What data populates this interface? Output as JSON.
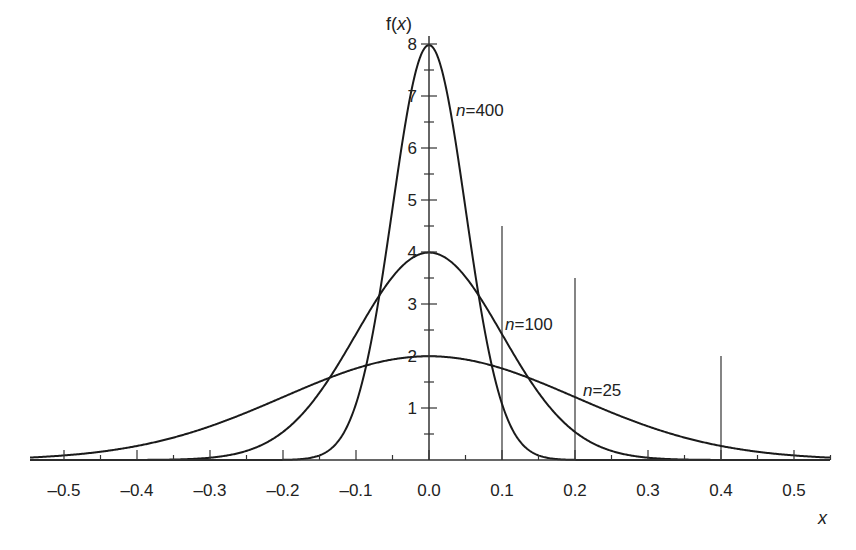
{
  "chart_data": {
    "type": "line",
    "title": "",
    "xlabel": "x",
    "ylabel": "f(x)",
    "xlim": [
      -0.55,
      0.55
    ],
    "ylim": [
      0,
      8.2
    ],
    "grid": false,
    "legend": "inline curve labels",
    "x_ticks": [
      "-0.5",
      "-0.4",
      "-0.3",
      "-0.2",
      "-0.1",
      "0.0",
      "0.1",
      "0.2",
      "0.3",
      "0.4",
      "0.5"
    ],
    "y_ticks": [
      "1",
      "2",
      "3",
      "4",
      "5",
      "6",
      "7",
      "8"
    ],
    "series": [
      {
        "name": "n=400",
        "label_n": "n",
        "label_val": "400",
        "distribution": "normal",
        "mean": 0,
        "sd": 0.05,
        "peak": 7.98
      },
      {
        "name": "n=100",
        "label_n": "n",
        "label_val": "100",
        "distribution": "normal",
        "mean": 0,
        "sd": 0.1,
        "peak": 3.99
      },
      {
        "name": "n=25",
        "label_n": "n",
        "label_val": "25",
        "distribution": "normal",
        "mean": 0,
        "sd": 0.2,
        "peak": 1.99
      }
    ],
    "reference_lines": [
      {
        "x": 0.1,
        "y_top": 4.5
      },
      {
        "x": 0.2,
        "y_top": 3.5
      },
      {
        "x": 0.4,
        "y_top": 2.0
      }
    ]
  },
  "labels": {
    "x_axis": "x",
    "y_axis_f": "f(",
    "y_axis_x": "x",
    "y_axis_close": ")"
  }
}
